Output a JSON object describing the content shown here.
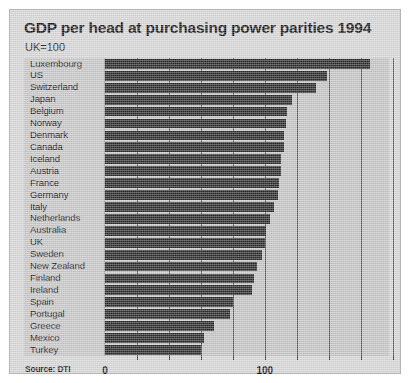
{
  "figure": {
    "title": "GDP per head at purchasing power parities 1994",
    "subtitle": "UK=100",
    "source": "Source: DTI",
    "background_color": "#d8d8d8",
    "panel_color": "#c6c6c6",
    "bar_color": "#2a2a2a",
    "gridline_color": "#5a5a5a"
  },
  "axis": {
    "labels": [
      "0",
      "100",
      "200"
    ],
    "label_values": [
      0,
      100,
      200
    ]
  },
  "chart_data": {
    "type": "bar",
    "orientation": "horizontal",
    "title": "GDP per head at purchasing power parities 1994",
    "subtitle": "UK=100",
    "xlabel": "",
    "ylabel": "",
    "xlim": [
      0,
      205
    ],
    "xticks": [
      0,
      100,
      200
    ],
    "gridlines": [
      20,
      40,
      60,
      80,
      100,
      120,
      140,
      160,
      180,
      200
    ],
    "grid": true,
    "legend": false,
    "source": "Source: DTI",
    "units": "UK=100",
    "categories": [
      "Luxembourg",
      "US",
      "Switzerland",
      "Japan",
      "Belgium",
      "Norway",
      "Denmark",
      "Canada",
      "Iceland",
      "Austria",
      "France",
      "Germany",
      "Italy",
      "Netherlands",
      "Australia",
      "UK",
      "Sweden",
      "New Zealand",
      "Finland",
      "Ireland",
      "Spain",
      "Portugal",
      "Greece",
      "Mexico",
      "Turkey"
    ],
    "values": [
      166,
      139,
      132,
      117,
      114,
      113,
      112,
      112,
      110,
      110,
      109,
      108,
      106,
      103,
      101,
      100,
      98,
      95,
      93,
      92,
      80,
      78,
      68,
      62,
      60
    ]
  }
}
